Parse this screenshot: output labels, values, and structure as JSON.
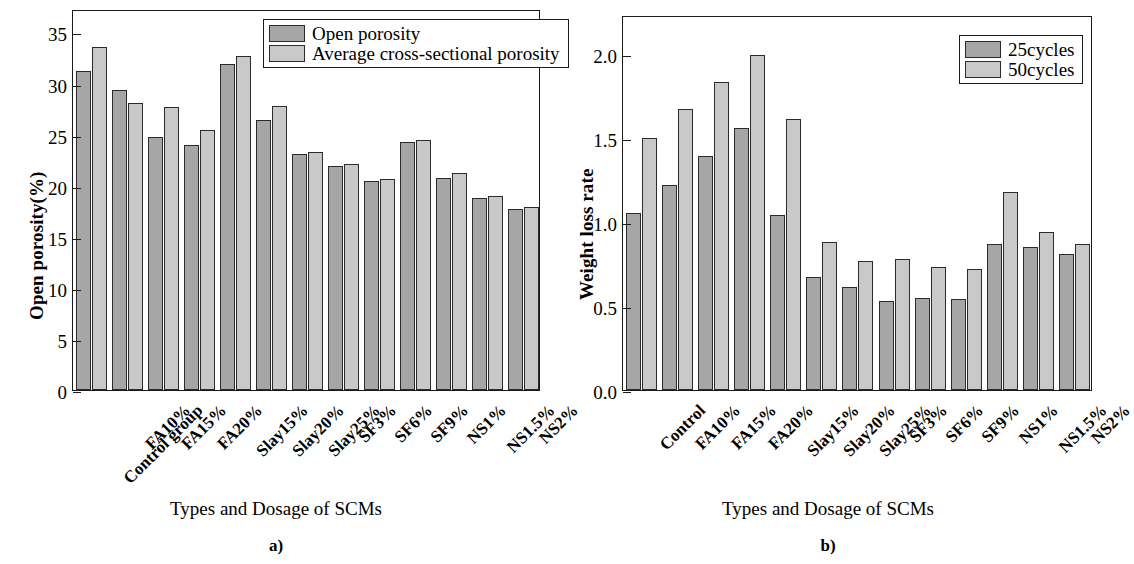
{
  "figure": {
    "panels": [
      {
        "id": "a",
        "caption": "a)",
        "xlabel": "Types and Dosage of SCMs",
        "ylabel": "Open porosity(%)"
      },
      {
        "id": "b",
        "caption": "b)",
        "xlabel": "Types and Dosage of SCMs",
        "ylabel": "Weight loss rate"
      }
    ]
  },
  "chart_data": [
    {
      "type": "bar",
      "title": "",
      "panel": "a",
      "xlabel": "Types and Dosage of SCMs",
      "ylabel": "Open porosity(%)",
      "ylim": [
        0,
        37.3
      ],
      "yticks": [
        0,
        5,
        10,
        15,
        20,
        25,
        30,
        35
      ],
      "ytick_labels": [
        "0",
        "5",
        "10",
        "15",
        "20",
        "25",
        "30",
        "35"
      ],
      "grid": false,
      "legend_position": "top-right",
      "categories": [
        "Control group",
        "FA10%",
        "FA15%",
        "FA20%",
        "Slay15%",
        "Slay20%",
        "Slay25%",
        "SF3%",
        "SF6%",
        "SF9%",
        "NS1%",
        "NS1.5%",
        "NS2%"
      ],
      "series": [
        {
          "name": "Open porosity",
          "color": "#a6a6a6",
          "values": [
            31.2,
            29.4,
            24.8,
            24.0,
            31.9,
            26.4,
            23.1,
            21.9,
            20.5,
            24.3,
            20.8,
            18.8,
            17.7
          ]
        },
        {
          "name": "Average cross-sectional porosity",
          "color": "#c9c9c9",
          "values": [
            33.6,
            28.1,
            27.7,
            25.5,
            32.7,
            27.8,
            23.3,
            22.1,
            20.7,
            24.5,
            21.2,
            19.0,
            17.9
          ]
        }
      ]
    },
    {
      "type": "bar",
      "title": "",
      "panel": "b",
      "xlabel": "Types and Dosage of SCMs",
      "ylabel": "Weight loss rate",
      "ylim": [
        0.0,
        2.23
      ],
      "yticks": [
        0.0,
        0.5,
        1.0,
        1.5,
        2.0
      ],
      "ytick_labels": [
        "0.0",
        "0.5",
        "1.0",
        "1.5",
        "2.0"
      ],
      "grid": false,
      "legend_position": "top-right",
      "categories": [
        "Control",
        "FA10%",
        "FA15%",
        "FA20%",
        "Slay15%",
        "Slay20%",
        "Slay25%",
        "SF3%",
        "SF6%",
        "SF9%",
        "NS1%",
        "NS1.5%",
        "NS2%"
      ],
      "series": [
        {
          "name": "25cycles",
          "color": "#a6a6a6",
          "values": [
            1.05,
            1.22,
            1.39,
            1.56,
            1.04,
            0.67,
            0.61,
            0.53,
            0.55,
            0.54,
            0.87,
            0.85,
            0.81
          ]
        },
        {
          "name": "50cycles",
          "color": "#c9c9c9",
          "values": [
            1.5,
            1.67,
            1.83,
            1.99,
            1.61,
            0.88,
            0.77,
            0.78,
            0.73,
            0.72,
            1.18,
            0.94,
            0.87
          ]
        }
      ]
    }
  ]
}
